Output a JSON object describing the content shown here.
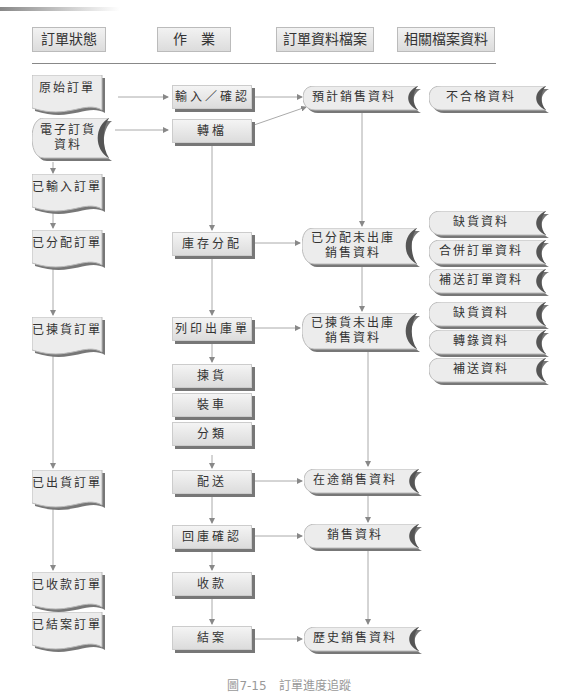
{
  "headers": [
    "訂單狀態",
    "作　業",
    "訂單資料檔案",
    "相關檔案資料"
  ],
  "order_states": [
    {
      "id": "s1",
      "label": "原始訂單",
      "shape": "document"
    },
    {
      "id": "s2",
      "label": "電子訂貨\n資料",
      "shape": "stored-data"
    },
    {
      "id": "s3",
      "label": "已輸入訂單",
      "shape": "document"
    },
    {
      "id": "s4",
      "label": "已分配訂單",
      "shape": "document"
    },
    {
      "id": "s5",
      "label": "已揀貨訂單",
      "shape": "document"
    },
    {
      "id": "s6",
      "label": "已出貨訂單",
      "shape": "document"
    },
    {
      "id": "s7",
      "label": "已收款訂單",
      "shape": "document"
    },
    {
      "id": "s8",
      "label": "已結案訂單",
      "shape": "document"
    }
  ],
  "operations": [
    {
      "id": "o1",
      "label": "輸入／確認"
    },
    {
      "id": "o2",
      "label": "轉檔"
    },
    {
      "id": "o3",
      "label": "庫存分配"
    },
    {
      "id": "o4",
      "label": "列印出庫單"
    },
    {
      "id": "o5",
      "label": "揀貨"
    },
    {
      "id": "o6",
      "label": "裝車"
    },
    {
      "id": "o7",
      "label": "分類"
    },
    {
      "id": "o8",
      "label": "配送"
    },
    {
      "id": "o9",
      "label": "回庫確認"
    },
    {
      "id": "o10",
      "label": "收款"
    },
    {
      "id": "o11",
      "label": "結案"
    }
  ],
  "order_files": [
    {
      "id": "f1",
      "label": "預計銷售資料"
    },
    {
      "id": "f2",
      "label": "已分配未出庫\n銷售資料"
    },
    {
      "id": "f3",
      "label": "已揀貨未出庫\n銷售資料"
    },
    {
      "id": "f4",
      "label": "在途銷售資料"
    },
    {
      "id": "f5",
      "label": "銷售資料"
    },
    {
      "id": "f6",
      "label": "歷史銷售資料"
    }
  ],
  "related_files": [
    {
      "id": "r1",
      "label": "不合格資料"
    },
    {
      "id": "r2",
      "label": "缺貨資料"
    },
    {
      "id": "r3",
      "label": "合併訂單資料"
    },
    {
      "id": "r4",
      "label": "補送訂單資料"
    },
    {
      "id": "r5",
      "label": "缺貨資料"
    },
    {
      "id": "r6",
      "label": "轉錄資料"
    },
    {
      "id": "r7",
      "label": "補送資料"
    }
  ],
  "caption": "圖7-15　訂單進度追蹤"
}
